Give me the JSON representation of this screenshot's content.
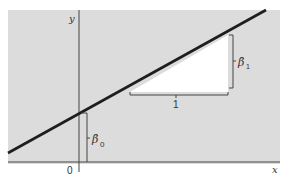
{
  "figure": {
    "colors": {
      "panel": "#dcdcdc",
      "axis": "#444444",
      "line": "#1e1e1e",
      "triangle": "#ffffff",
      "text": "#333333"
    },
    "axes": {
      "x_label": "x",
      "y_label": "y",
      "origin_label": "0"
    },
    "regression_line": {
      "description": "Fitted regression line y = β̂0 + β̂1 x"
    },
    "annotations": {
      "intercept_label": "β̂",
      "intercept_subscript": "0",
      "slope_label": "β̂",
      "slope_subscript": "1",
      "run_label": "1"
    }
  }
}
